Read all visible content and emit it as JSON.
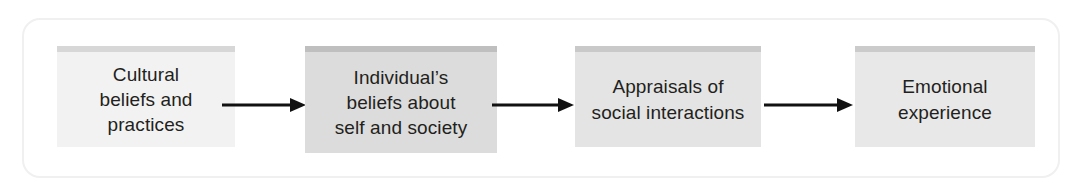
{
  "diagram": {
    "type": "linear-flow-chart",
    "title": "",
    "frame": {
      "border_color": "#f0f0f0",
      "background": "#ffffff"
    },
    "boxes": [
      {
        "id": "cultural-beliefs",
        "label": "Cultural\nbeliefs and\npractices",
        "lines": [
          "Cultural",
          "beliefs and",
          "practices"
        ],
        "fill": "#f2f2f2",
        "top_bar_color": "#d7d7d7",
        "text_color": "#231f20",
        "x": 57,
        "y": 46,
        "width": 178,
        "height": 101
      },
      {
        "id": "individual-beliefs",
        "label": "Individual’s\nbeliefs about\nself and society",
        "lines": [
          "Individual’s",
          "beliefs about",
          "self and society"
        ],
        "fill": "#dcdcdc",
        "top_bar_color": "#bfbfbf",
        "text_color": "#231f20",
        "x": 305,
        "y": 46,
        "width": 192,
        "height": 107
      },
      {
        "id": "appraisals-social",
        "label": "Appraisals of\nsocial interactions",
        "lines": [
          "Appraisals of",
          "social interactions"
        ],
        "fill": "#e4e4e4",
        "top_bar_color": "#c9c9c9",
        "text_color": "#231f20",
        "x": 575,
        "y": 46,
        "width": 186,
        "height": 101
      },
      {
        "id": "emotional-experience",
        "label": "Emotional\nexperience",
        "lines": [
          "Emotional",
          "experience"
        ],
        "fill": "#e8e8e8",
        "top_bar_color": "#cbcbcb",
        "text_color": "#231f20",
        "x": 855,
        "y": 46,
        "width": 180,
        "height": 101
      }
    ],
    "arrows": [
      {
        "id": "arrow-1",
        "from": "cultural-beliefs",
        "to": "individual-beliefs",
        "direction": "right",
        "color": "#111111",
        "x": 222,
        "y": 95,
        "length": 84
      },
      {
        "id": "arrow-2",
        "from": "individual-beliefs",
        "to": "appraisals-social",
        "direction": "right",
        "color": "#111111",
        "x": 492,
        "y": 95,
        "length": 82
      },
      {
        "id": "arrow-3",
        "from": "appraisals-social",
        "to": "emotional-experience",
        "direction": "right",
        "color": "#111111",
        "x": 764,
        "y": 95,
        "length": 89
      }
    ]
  }
}
